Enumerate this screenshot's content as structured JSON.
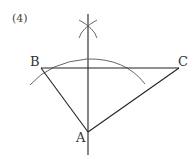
{
  "figure": {
    "problem_number": "(4)",
    "points": {
      "A": {
        "label": "A",
        "x": 88,
        "y": 132
      },
      "B": {
        "label": "B",
        "x": 41,
        "y": 68
      },
      "C": {
        "label": "C",
        "x": 179,
        "y": 68
      }
    },
    "stroke_color": "#222222",
    "arc_color": "#555555"
  }
}
